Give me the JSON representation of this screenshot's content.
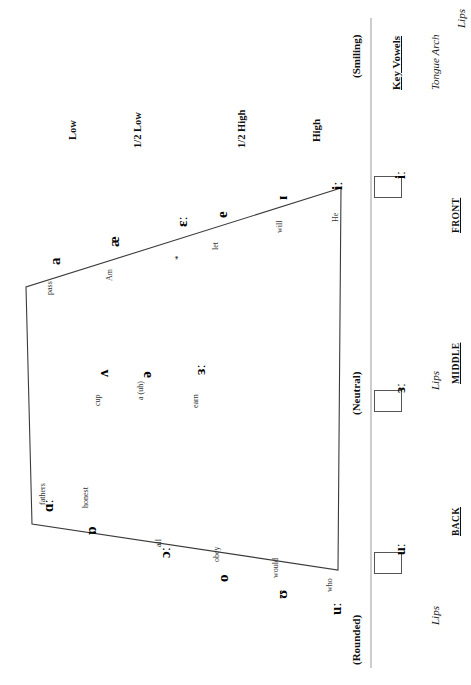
{
  "chart": {
    "title": "Key Vowels",
    "type": "vowel-quadrilateral",
    "orientation": "rotated-90-clockwise",
    "line_color": "#3a3a3a",
    "divider_color": "#b8b8b8",
    "box_border_color": "#555555"
  },
  "headers": {
    "lips_top": "Lips",
    "tongue_arch": "Tongue Arch",
    "key_vowels": "Key Vowels",
    "lips_middle": "Lips",
    "lips_bottom": "Lips",
    "front": "FRONT",
    "middle": "MIDDLE",
    "back": "BACK"
  },
  "lip_states": {
    "smiling": "(Smiling)",
    "neutral": "(Neutral)",
    "rounded": "(Rounded)"
  },
  "heights": {
    "high": "High",
    "half_high": "1/2 High",
    "half_low": "1/2 Low",
    "low": "Low"
  },
  "key_boxes": [
    {
      "symbol": "iː",
      "row": "front"
    },
    {
      "symbol": "ɜː",
      "row": "middle"
    },
    {
      "symbol": "uː",
      "row": "back"
    }
  ],
  "vowels": [
    {
      "symbol": "iː",
      "keyword": "He",
      "star": false
    },
    {
      "symbol": "ɪ",
      "keyword": "will",
      "star": false
    },
    {
      "symbol": "e",
      "keyword": "let",
      "star": false
    },
    {
      "symbol": "ɛː",
      "keyword": "",
      "star": true
    },
    {
      "symbol": "æ",
      "keyword": "Am",
      "star": false
    },
    {
      "symbol": "a",
      "keyword": "pass",
      "star": false
    },
    {
      "symbol": "ɜː",
      "keyword": "earn",
      "star": false
    },
    {
      "symbol": "ə",
      "keyword": "a (uh)",
      "star": false
    },
    {
      "symbol": "ʌ",
      "keyword": "cup",
      "star": false
    },
    {
      "symbol": "ɑː",
      "keyword": "fathers",
      "star": false
    },
    {
      "symbol": "ɒ",
      "keyword": "honest",
      "star": false
    },
    {
      "symbol": "ɔː",
      "keyword": "all",
      "star": false
    },
    {
      "symbol": "o",
      "keyword": "obey",
      "star": false
    },
    {
      "symbol": "ʊ",
      "keyword": "would",
      "star": false
    },
    {
      "symbol": "uː",
      "keyword": "who",
      "star": false
    }
  ],
  "star_marker": "*"
}
